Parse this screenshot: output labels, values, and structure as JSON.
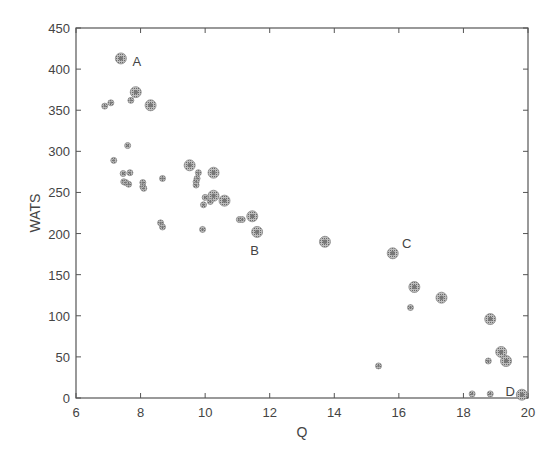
{
  "chart_data": {
    "type": "scatter",
    "title": "",
    "xlabel": "Q",
    "ylabel": "WATS",
    "xlim": [
      6,
      20
    ],
    "ylim": [
      0,
      450
    ],
    "xticks": [
      6,
      8,
      10,
      12,
      14,
      16,
      18,
      20
    ],
    "yticks": [
      0,
      50,
      100,
      150,
      200,
      250,
      300,
      350,
      400,
      450
    ],
    "grid": false,
    "legend": null,
    "series": [
      {
        "name": "large",
        "marker": "hatched-circle-large",
        "points": [
          [
            7.39,
            413
          ],
          [
            7.85,
            372
          ],
          [
            8.31,
            356
          ],
          [
            9.52,
            283
          ],
          [
            10.26,
            274
          ],
          [
            10.26,
            246
          ],
          [
            10.6,
            240
          ],
          [
            11.46,
            221
          ],
          [
            11.61,
            202
          ],
          [
            13.71,
            190
          ],
          [
            15.81,
            176
          ],
          [
            16.48,
            135
          ],
          [
            17.32,
            122
          ],
          [
            18.83,
            96
          ],
          [
            19.17,
            56
          ],
          [
            19.32,
            45
          ],
          [
            19.81,
            4
          ]
        ]
      },
      {
        "name": "small",
        "marker": "hatched-circle-small",
        "points": [
          [
            6.89,
            355
          ],
          [
            7.08,
            359
          ],
          [
            7.7,
            362
          ],
          [
            7.6,
            307
          ],
          [
            7.17,
            289
          ],
          [
            7.46,
            273
          ],
          [
            7.67,
            274
          ],
          [
            7.48,
            263
          ],
          [
            7.54,
            262
          ],
          [
            7.63,
            260
          ],
          [
            8.07,
            262
          ],
          [
            8.07,
            257
          ],
          [
            8.1,
            255
          ],
          [
            8.68,
            267
          ],
          [
            8.62,
            213
          ],
          [
            8.68,
            208
          ],
          [
            9.79,
            274
          ],
          [
            9.75,
            267
          ],
          [
            9.72,
            263
          ],
          [
            9.72,
            259
          ],
          [
            10.0,
            244
          ],
          [
            10.16,
            239
          ],
          [
            9.95,
            235
          ],
          [
            9.92,
            205
          ],
          [
            11.06,
            217
          ],
          [
            11.15,
            217
          ],
          [
            16.36,
            110
          ],
          [
            15.37,
            39
          ],
          [
            18.77,
            45
          ],
          [
            18.27,
            5
          ],
          [
            18.83,
            5
          ]
        ]
      }
    ],
    "annotations": [
      {
        "text": "A",
        "x": 7.75,
        "y": 410
      },
      {
        "text": "B",
        "x": 11.4,
        "y": 180
      },
      {
        "text": "C",
        "x": 16.1,
        "y": 188
      },
      {
        "text": "D",
        "x": 19.3,
        "y": 8
      }
    ]
  }
}
